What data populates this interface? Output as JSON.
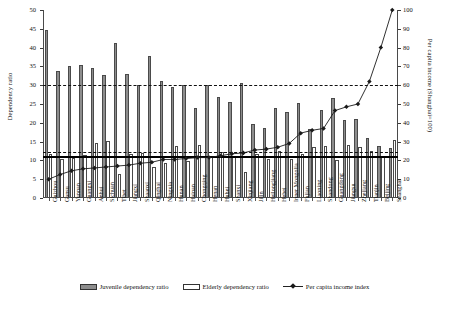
{
  "chart_data": {
    "type": "bar",
    "title": "",
    "xlabel": "",
    "ylabel": "Dependency ratio",
    "ylabel_right": "Per capita income (Shanghai=100)",
    "ylim": [
      0,
      50
    ],
    "ylim_right": [
      0,
      100
    ],
    "yticks": [
      0,
      5,
      10,
      15,
      20,
      25,
      30,
      35,
      40,
      45,
      50
    ],
    "yticks_right": [
      0,
      10,
      20,
      30,
      40,
      50,
      60,
      70,
      80,
      90,
      100
    ],
    "grid": false,
    "legend_position": "bottom",
    "categories": [
      "Guizhou",
      "Gansu",
      "Yunnan",
      "Guangxi",
      "Anhui",
      "Sichuan",
      "Tibet",
      "Jiangxi",
      "Shaanxi",
      "Qinghai",
      "Ningxia",
      "Hunan",
      "Hainan",
      "Chongqing",
      "Henan",
      "Hubei",
      "Shanxi",
      "Xinjiang",
      "Jilin",
      "Heilongjiang",
      "Hebei",
      "Inner Mongolia",
      "Fujian",
      "Liaoning",
      "Shandong",
      "Guangdong",
      "Jiangsu",
      "Zhejiang",
      "Tianjin",
      "Beijing",
      "Shanghai"
    ],
    "series": [
      {
        "name": "Juvenile dependency ratio",
        "type": "bar",
        "color": "#8d8d8d",
        "axis": "left",
        "values": [
          44.6,
          33.8,
          35.2,
          35.5,
          34.5,
          32.7,
          41.2,
          33.0,
          30.0,
          37.9,
          31.0,
          29.5,
          30.0,
          24.0,
          30.0,
          26.8,
          25.5,
          30.5,
          19.7,
          18.5,
          24.0,
          22.8,
          25.2,
          18.3,
          23.5,
          26.5,
          20.8,
          21.0,
          16.0,
          13.8,
          13.2
        ]
      },
      {
        "name": "Elderly dependency ratio",
        "type": "bar",
        "color": "#ffffff",
        "axis": "left",
        "values": [
          11.8,
          10.5,
          10.6,
          11.4,
          14.6,
          15.2,
          6.5,
          11.8,
          11.9,
          8.2,
          9.3,
          13.9,
          9.8,
          14.2,
          11.0,
          12.2,
          10.8,
          7.0,
          11.6,
          10.5,
          12.6,
          10.3,
          11.8,
          13.7,
          13.8,
          10.0,
          14.2,
          13.5,
          12.6,
          11.2,
          15.4
        ]
      },
      {
        "name": "Per capita income index",
        "type": "line",
        "color": "#1a1a1a",
        "axis": "right",
        "values": [
          10.0,
          12.5,
          14.5,
          15.5,
          16.0,
          16.5,
          17.0,
          17.5,
          18.5,
          19.0,
          20.5,
          20.5,
          21.0,
          21.5,
          21.5,
          22.5,
          23.5,
          24.0,
          25.5,
          26.0,
          27.0,
          29.0,
          34.5,
          36.0,
          37.0,
          46.5,
          48.5,
          50.0,
          62.0,
          80.0,
          100.0
        ]
      }
    ],
    "reference_lines": [
      {
        "name": "dash-dot-line",
        "value": 30,
        "axis": "left",
        "style": "dash-dot"
      },
      {
        "name": "dashed-line",
        "value": 12.2,
        "axis": "left",
        "style": "dashed"
      },
      {
        "name": "solid-line",
        "value": 11.3,
        "axis": "left",
        "style": "solid"
      }
    ]
  },
  "legend": {
    "items": [
      {
        "label": "Juvenile dependency ratio",
        "marker": "gray-bar-swatch"
      },
      {
        "label": "Elderly dependency ratio",
        "marker": "white-bar-swatch"
      },
      {
        "label": "Per capita income index",
        "marker": "line-diamond-marker"
      }
    ]
  }
}
